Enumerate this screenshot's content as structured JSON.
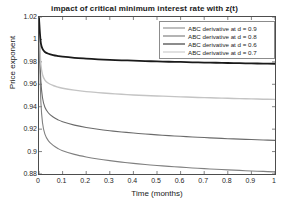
{
  "chart_data": {
    "type": "line",
    "title": "impact of critical minimum interest rate with z(t)",
    "xlabel": "Time (months)",
    "ylabel": "Price exponent",
    "xlim": [
      0,
      1
    ],
    "ylim": [
      0.88,
      1.02
    ],
    "xticks": [
      "0",
      "0.1",
      "0.2",
      "0.3",
      "0.4",
      "0.5",
      "0.6",
      "0.7",
      "0.8",
      "0.9",
      "1"
    ],
    "xtick_values": [
      0,
      0.1,
      0.2,
      0.3,
      0.4,
      0.5,
      0.6,
      0.7,
      0.8,
      0.9,
      1
    ],
    "yticks": [
      "0.88",
      "0.9",
      "0.92",
      "0.94",
      "0.96",
      "0.98",
      "1",
      "1.02"
    ],
    "ytick_values": [
      0.88,
      0.9,
      0.92,
      0.94,
      0.96,
      0.98,
      1.0,
      1.02
    ],
    "grid": false,
    "legend_position": "upper right",
    "series": [
      {
        "name": "ABC derivative  at d = 0.9",
        "color": "#808080",
        "width": 1.1,
        "x": [
          0,
          0.004,
          0.008,
          0.015,
          0.025,
          0.04,
          0.06,
          0.08,
          0.1,
          0.15,
          0.2,
          0.25,
          0.3,
          0.35,
          0.4,
          0.45,
          0.5,
          0.55,
          0.6,
          0.65,
          0.7,
          0.75,
          0.8,
          0.85,
          0.9,
          0.95,
          1.0
        ],
        "y": [
          1.019,
          0.975,
          0.944,
          0.9255,
          0.9155,
          0.9095,
          0.9055,
          0.9028,
          0.9008,
          0.8975,
          0.8952,
          0.8934,
          0.8919,
          0.8906,
          0.8895,
          0.8885,
          0.8876,
          0.8868,
          0.8861,
          0.8854,
          0.8848,
          0.8842,
          0.8837,
          0.8832,
          0.8827,
          0.8823,
          0.8819
        ]
      },
      {
        "name": "ABC derivative  at d = 0.8",
        "color": "#6b6b6b",
        "width": 1.1,
        "x": [
          0,
          0.004,
          0.008,
          0.015,
          0.025,
          0.04,
          0.06,
          0.08,
          0.1,
          0.15,
          0.2,
          0.25,
          0.3,
          0.35,
          0.4,
          0.45,
          0.5,
          0.55,
          0.6,
          0.65,
          0.7,
          0.75,
          0.8,
          0.85,
          0.9,
          0.95,
          1.0
        ],
        "y": [
          1.019,
          0.985,
          0.9625,
          0.9478,
          0.9395,
          0.9344,
          0.9308,
          0.9284,
          0.9266,
          0.9236,
          0.9215,
          0.9199,
          0.9186,
          0.9175,
          0.9165,
          0.9157,
          0.9149,
          0.9142,
          0.9136,
          0.913,
          0.9125,
          0.912,
          0.9115,
          0.9111,
          0.9107,
          0.9103,
          0.91
        ]
      },
      {
        "name": "ABC derivative  at d = 0.6",
        "color": "#1a1a1a",
        "width": 1.8,
        "x": [
          0,
          0.004,
          0.008,
          0.015,
          0.025,
          0.04,
          0.06,
          0.08,
          0.1,
          0.15,
          0.2,
          0.25,
          0.3,
          0.35,
          0.4,
          0.45,
          0.5,
          0.55,
          0.6,
          0.65,
          0.7,
          0.75,
          0.8,
          0.85,
          0.9,
          0.95,
          1.0
        ],
        "y": [
          1.019,
          1.0055,
          0.9965,
          0.9915,
          0.9888,
          0.9872,
          0.986,
          0.9852,
          0.9846,
          0.9836,
          0.9829,
          0.9823,
          0.9818,
          0.9814,
          0.9811,
          0.9807,
          0.9804,
          0.9801,
          0.9799,
          0.9796,
          0.9794,
          0.9792,
          0.979,
          0.9788,
          0.9786,
          0.9785,
          0.9783
        ]
      },
      {
        "name": "ABC derivative  at d = 0.7",
        "color": "#c4c4c4",
        "width": 1.4,
        "x": [
          0,
          0.004,
          0.008,
          0.015,
          0.025,
          0.04,
          0.06,
          0.08,
          0.1,
          0.15,
          0.2,
          0.25,
          0.3,
          0.35,
          0.4,
          0.45,
          0.5,
          0.55,
          0.6,
          0.65,
          0.7,
          0.75,
          0.8,
          0.85,
          0.9,
          0.95,
          1.0
        ],
        "y": [
          1.019,
          0.9935,
          0.9775,
          0.9685,
          0.9637,
          0.9609,
          0.9589,
          0.9575,
          0.9565,
          0.9548,
          0.9535,
          0.9526,
          0.9518,
          0.9511,
          0.9505,
          0.95,
          0.9496,
          0.9492,
          0.9488,
          0.9484,
          0.9481,
          0.9478,
          0.9475,
          0.9472,
          0.947,
          0.9467,
          0.9465
        ]
      }
    ]
  }
}
